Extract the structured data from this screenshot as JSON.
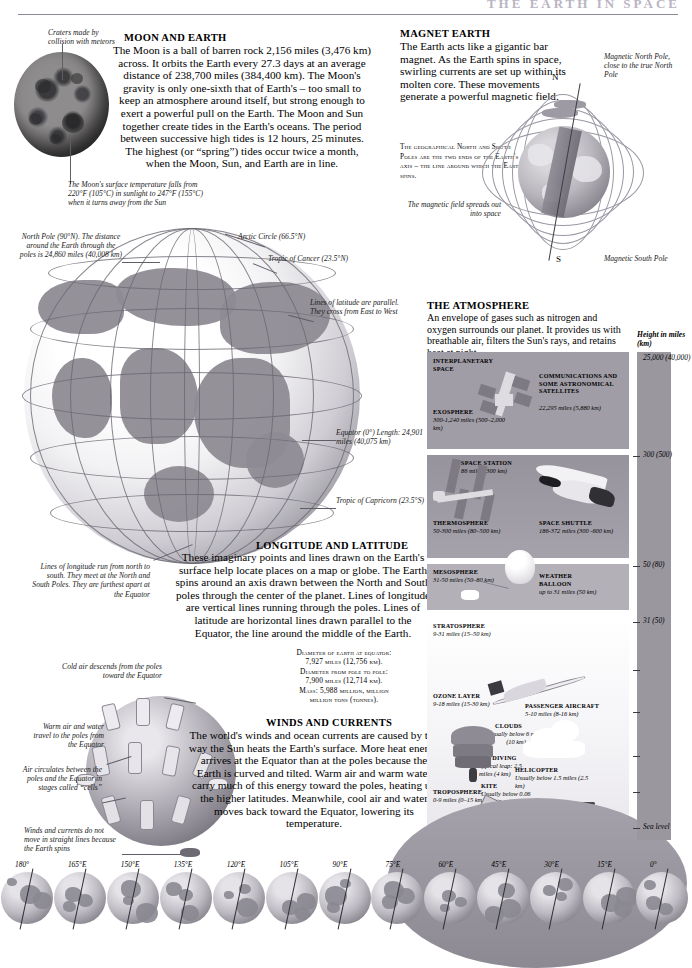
{
  "header": {
    "title": "THE EARTH IN SPACE"
  },
  "moon": {
    "heading": "MOON AND EARTH",
    "body": "The Moon is a ball of barren rock 2,156 miles (3,476 km) across. It orbits the Earth every 27.3 days at an average distance of 238,700 miles (384,400 km). The Moon's gravity is only one-sixth that of Earth's – too small to keep an atmosphere around itself, but strong enough to exert a powerful pull on the Earth. The Moon and Sun together create tides in the Earth's oceans. The period between successive high tides is 12 hours, 25 minutes. The highest (or “spring”) tides occur twice a month, when the Moon, Sun, and Earth are in line.",
    "caption_craters": "Craters made by collision with meteors",
    "caption_temperature": "The Moon's surface temperature falls from 220°F (105°C) in sunlight to 247°F (155°C) when it turns away from the Sun"
  },
  "magnet": {
    "heading": "MAGNET EARTH",
    "body": "The Earth acts like a gigantic bar magnet. As the Earth spins in space, swirling currents are set up within its molten core. These movements generate a powerful magnetic field.",
    "smallcaps_note": "The geographical North and South Poles are the two ends of the Earth's axis – the line around which the Earth spins.",
    "caption_field": "The magnetic field spreads out into space",
    "caption_north": "Magnetic North Pole, close to the true North Pole",
    "caption_south": "Magnetic South Pole",
    "pole_n": "N",
    "pole_s": "S"
  },
  "globe": {
    "caption_north_pole": "North Pole (90°N). The distance around the Earth through the poles is 24,860 miles (40,008 km)",
    "caption_arctic": "Arctic Circle (66.5°N)",
    "caption_cancer": "Tropic of Cancer (23.5°N)",
    "caption_latitude": "Lines of latitude are parallel. They cross from East to West",
    "caption_equator": "Equator (0°) Length: 24,901 miles (40,075 km)",
    "caption_capricorn": "Tropic of Capricorn (23.5°S)",
    "caption_longitude": "Lines of longitude run from north to south. They meet at the North and South Poles. They are furthest apart at the Equator"
  },
  "lonlat": {
    "heading": "LONGITUDE AND LATITUDE",
    "body": "These imaginary points and lines drawn on the Earth's surface help locate places on a map or globe. The Earth spins around an axis drawn between the North and South poles through the center of the planet. Lines of longitude are vertical lines running through the poles. Lines of latitude are horizontal lines drawn parallel to the Equator, the line around the middle of the Earth."
  },
  "facts": {
    "line1": "Diameter of earth at equator:",
    "line2": "7,927 miles (12,756 km).",
    "line3": "Diameter from pole to pole:",
    "line4": "7,900 miles (12,714 km).",
    "line5": "Mass: 5,988 million, million",
    "line6": "million tons (tonnes)."
  },
  "winds": {
    "heading": "WINDS AND CURRENTS",
    "body": "The world's winds and ocean currents are caused by the way the Sun heats the Earth's surface. More heat energy arrives at the Equator than at the poles because the Earth is curved and tilted. Warm air and warm water carry much of this energy toward the poles, heating up the higher latitudes. Meanwhile, cool air and water moves back toward the Equator, lowering its temperature.",
    "caption_cold": "Cold air descends from the poles toward the Equator",
    "caption_warm": "Warm air and water travel to the poles from the Equator",
    "caption_cells": "Air circulates between the poles and the Equator in stages called “cells”",
    "caption_straight": "Winds and currents do not move in straight lines because the Earth spins"
  },
  "atmosphere": {
    "heading": "THE ATMOSPHERE",
    "body": "An envelope of gases such as nitrogen and oxygen surrounds our planet. It provides us with breathable air, filters the Sun's rays, and retains heat at night.",
    "scale_heading": "Height in miles (km)",
    "scale_ticks": [
      {
        "label": "25,000 (40,000)"
      },
      {
        "label": "300 (500)"
      },
      {
        "label": "50 (80)"
      },
      {
        "label": "31 (50)"
      },
      {
        "label": "Sea level"
      }
    ],
    "layers": [
      {
        "name": "INTERPLANETARY SPACE",
        "layer_label": "EXOSPHERE",
        "layer_range": "300-1,240 miles (500–2,000 km)",
        "object_label": "COMMUNICATIONS AND SOME ASTRONOMICAL SATELLITES",
        "object_range": "22,295 miles (5,880 km)"
      },
      {
        "layer_label": "THERMOSPHERE",
        "layer_range": "50-300 miles (80–500 km)",
        "object1_label": "SPACE STATION",
        "object1_range": "86 miles (300 km)",
        "object2_label": "SPACE SHUTTLE",
        "object2_range": "186-372 miles (300 -600 km)"
      },
      {
        "layer_label": "MESOSPHERE",
        "layer_range": "31-50 miles (50–80 km)",
        "object_label": "WEATHER BALLOON",
        "object_range": "up to 31 miles (50 km)"
      },
      {
        "layer_label": "STRATOSPHERE",
        "layer_range": "9-31 miles (15–50 km)",
        "ozone_label": "OZONE LAYER",
        "ozone_range": "9-18 miles (15-30 km)",
        "aircraft_label": "PASSENGER AIRCRAFT",
        "aircraft_range": "5-10 miles (8-16 km)",
        "clouds_label": "CLOUDS",
        "clouds_range": "Usually below 6 miles (10 km)",
        "sky_label": "SKYDIVING",
        "sky_range": "Typical leap: 2.5 miles (4 km)",
        "heli_label": "HELICOPTER",
        "heli_range": "Usually below 1.5 miles (2.5 km)",
        "kite_label": "KITE",
        "kite_range": "Usually below 0.06 miles (0.1 km)",
        "tropo_label": "TROPOSPHERE",
        "tropo_range": "0-9 miles (0–15 km)"
      }
    ]
  },
  "longitude_strip": {
    "labels": [
      "180°",
      "165°E",
      "150°E",
      "135°E",
      "120°E",
      "105°E",
      "90°E",
      "75°E",
      "60°E",
      "45°E",
      "30°E",
      "15°E",
      "0°"
    ]
  },
  "colors": {
    "panel_gray": "#a09da6",
    "scale_gray": "#9a979f",
    "rule_gray": "#8e8a96",
    "header_text": "#b9b5c4"
  }
}
